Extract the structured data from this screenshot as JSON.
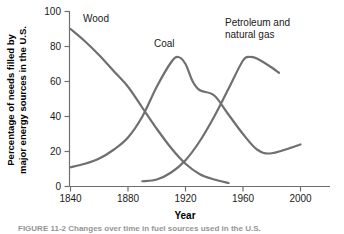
{
  "chart_data": {
    "type": "line",
    "title": "",
    "xlabel": "Year",
    "ylabel": "Percentage of needs filled by major energy sources in the U.S.",
    "ylabel_line1": "Percentage of needs filled by",
    "ylabel_line2": "major energy sources in the U.S.",
    "xlim": [
      1840,
      2010
    ],
    "ylim": [
      0,
      100
    ],
    "grid": false,
    "legend_position": "inline-labels",
    "xticks": [
      1840,
      1880,
      1920,
      1960,
      2000
    ],
    "yticks": [
      0,
      20,
      40,
      60,
      80,
      100
    ],
    "series_color": "#6f6f6f",
    "series": [
      {
        "name": "Wood",
        "label": "Wood",
        "label_x": 1848,
        "label_y": 95,
        "x": [
          1840,
          1850,
          1860,
          1870,
          1880,
          1890,
          1900,
          1910,
          1920,
          1930,
          1940,
          1950
        ],
        "values": [
          90,
          83,
          75,
          66,
          57,
          45,
          33,
          22,
          13,
          7,
          4,
          2
        ]
      },
      {
        "name": "Coal",
        "label": "Coal",
        "label_x": 1902,
        "label_y": 86,
        "x": [
          1840,
          1850,
          1860,
          1870,
          1880,
          1890,
          1900,
          1910,
          1915,
          1920,
          1925,
          1930,
          1940,
          1950,
          1960,
          1970,
          1980,
          2000
        ],
        "values": [
          11,
          13,
          16,
          21,
          28,
          40,
          57,
          71,
          74,
          70,
          60,
          55,
          52,
          41,
          30,
          21,
          19,
          24
        ]
      },
      {
        "name": "Petroleum and natural gas",
        "label": "Petroleum and natural gas",
        "label_line1": "Petroleum and",
        "label_line2": "natural gas",
        "label_x": 1945,
        "label_y": 96,
        "x": [
          1890,
          1900,
          1910,
          1920,
          1930,
          1940,
          1950,
          1960,
          1965,
          1970,
          1980,
          1985
        ],
        "values": [
          3,
          4,
          8,
          15,
          26,
          40,
          56,
          72,
          74,
          73,
          68,
          65
        ]
      }
    ]
  },
  "caption": {
    "text": "FIGURE 11-2  Changes over time in fuel sources used in the U.S."
  }
}
